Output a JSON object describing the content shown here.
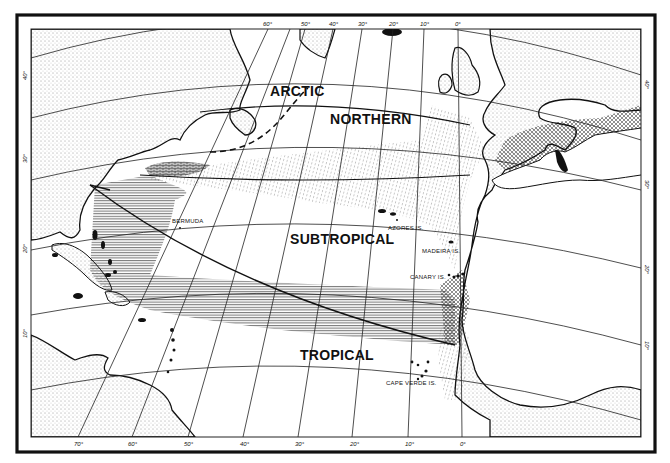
{
  "map": {
    "title": "Zonal divisions of the North Atlantic Ocean",
    "zones": [
      {
        "id": "arctic",
        "label": "ARCTIC"
      },
      {
        "id": "northern",
        "label": "NORTHERN"
      },
      {
        "id": "subtropical",
        "label": "SUBTROPICAL"
      },
      {
        "id": "tropical",
        "label": "TROPICAL"
      }
    ],
    "places": [
      {
        "id": "bermuda",
        "label": "BERMUDA"
      },
      {
        "id": "azores",
        "label": "AZORES IS."
      },
      {
        "id": "madeira",
        "label": "MADEIRA IS."
      },
      {
        "id": "canary",
        "label": "CANARY IS."
      },
      {
        "id": "cape_verde",
        "label": "CAPE VERDE IS."
      }
    ],
    "longitude_ticks_bottom": [
      "70°",
      "60°",
      "50°",
      "40°",
      "30°",
      "20°",
      "10°",
      "0°"
    ],
    "longitude_ticks_top": [
      "60°",
      "50°",
      "40°",
      "30°",
      "20°",
      "10°",
      "0°"
    ],
    "latitude_ticks_left": [
      "40°",
      "30°",
      "20°",
      "10°"
    ],
    "latitude_ticks_right": [
      "40°",
      "30°",
      "20°",
      "10°"
    ],
    "legend_patterns": {
      "stipple": "land",
      "dotted_hatch": "northern-subtropical boundary zone",
      "horizontal_lines": "western/tropical boundary zone",
      "cross_hatch": "overlap zone"
    },
    "colors": {
      "ink": "#111111",
      "paper": "#ffffff"
    }
  }
}
